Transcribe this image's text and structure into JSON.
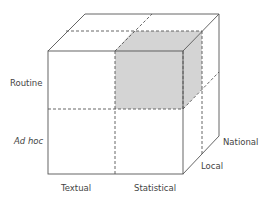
{
  "diagram": {
    "type": "3d-cube-matrix",
    "axes": {
      "vertical": [
        "Routine",
        "Ad hoc"
      ],
      "horizontal": [
        "Textual",
        "Statistical"
      ],
      "depth": [
        "Local",
        "National"
      ]
    },
    "highlighted_cell": {
      "vertical": "Routine",
      "horizontal": "Statistical",
      "depth": "Local",
      "fill": "#d4d4d4"
    },
    "colors": {
      "line": "#555555",
      "dashed": "#555555",
      "shade": "#d4d4d4",
      "text": "#444444"
    }
  },
  "labels": {
    "routine": "Routine",
    "ad_hoc": "Ad hoc",
    "textual": "Textual",
    "statistical": "Statistical",
    "local": "Local",
    "national": "National"
  }
}
